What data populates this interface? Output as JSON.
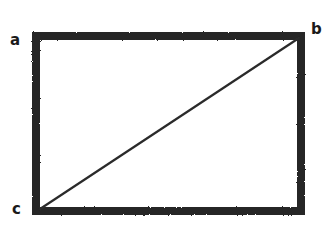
{
  "figure": {
    "name": "rectangle-with-diagonal",
    "background_color": "#ffffff",
    "ink_color": "#262626",
    "style": "scanned-hand-drawn"
  },
  "labels": {
    "a": "a",
    "b": "b",
    "c": "c"
  },
  "diagram_data": {
    "type": "geometric-figure",
    "shape": "rectangle",
    "description": "A rectangle with a thick dark border and a thin straight diagonal segment drawn from the bottom-left corner to the top-right corner, forming two right triangles.",
    "vertices": [
      {
        "id": "a",
        "label": "a",
        "role": "top-left-corner",
        "x": 36,
        "y": 36,
        "label_x": 15,
        "label_y": 41
      },
      {
        "id": "b",
        "label": "b",
        "role": "top-right-corner",
        "x": 301,
        "y": 36,
        "label_x": 316,
        "label_y": 30
      },
      {
        "id": "c",
        "label": "c",
        "role": "bottom-left-corner",
        "x": 36,
        "y": 211,
        "label_x": 17,
        "label_y": 210
      },
      {
        "id": "d",
        "label": "",
        "role": "bottom-right-corner",
        "x": 301,
        "y": 211,
        "label_x": 0,
        "label_y": 0
      }
    ],
    "rectangle": {
      "x": 32,
      "y": 32,
      "width": 273,
      "height": 183,
      "stroke_width": 8,
      "stroke_color": "#262626",
      "fill": "none"
    },
    "diagonal": {
      "from": "c",
      "to": "b",
      "x1": 40,
      "y1": 209,
      "x2": 299,
      "y2": 38,
      "stroke_width": 2.2,
      "stroke_color": "#2b2b2b"
    },
    "label_font_size_px": 15,
    "label_font_weight": "bold"
  }
}
